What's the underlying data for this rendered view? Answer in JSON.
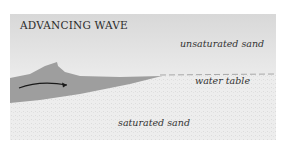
{
  "diagram": {
    "title": "ADVANCING WAVE",
    "labels": {
      "unsaturated": "unsaturated sand",
      "water_table": "water table",
      "saturated": "saturated sand"
    },
    "colors": {
      "sky_sand": "#e6e6e6",
      "saturated_sand": "#ececec",
      "wave": "#9e9e9e",
      "arrow": "#1a1a1a"
    }
  }
}
